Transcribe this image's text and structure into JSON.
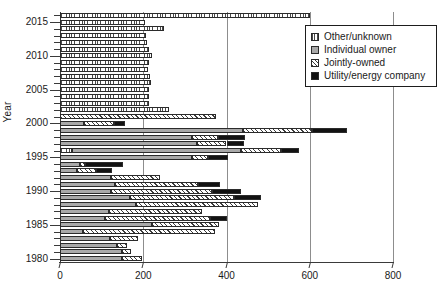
{
  "chart_data": {
    "type": "bar",
    "orientation": "horizontal",
    "stacked": true,
    "title": "",
    "xlabel": "",
    "ylabel": "Year",
    "xlim": [
      0,
      800
    ],
    "ylim": [
      1979.5,
      2016.5
    ],
    "xticks": [
      0,
      200,
      400,
      600,
      800
    ],
    "yticks": [
      1980,
      1985,
      1990,
      1995,
      2000,
      2005,
      2010,
      2015
    ],
    "grid": "vertical",
    "legend_position": "top-right",
    "series": [
      {
        "name": "Other/unknown",
        "key": "other",
        "color": "#ffffff",
        "hatch": "horizontal-dotted"
      },
      {
        "name": "Individual owner",
        "key": "individual",
        "color": "#a9a9a9",
        "hatch": "solid"
      },
      {
        "name": "Jointly-owned",
        "key": "joint",
        "color": "#ffffff",
        "hatch": "diagonal"
      },
      {
        "name": "Utility/energy company",
        "key": "utility",
        "color": "#121212",
        "hatch": "solid"
      }
    ],
    "categories": [
      1980,
      1981,
      1982,
      1983,
      1984,
      1985,
      1986,
      1987,
      1988,
      1989,
      1990,
      1991,
      1992,
      1993,
      1994,
      1995,
      1996,
      1997,
      1998,
      1999,
      2000,
      2001,
      2002,
      2003,
      2004,
      2005,
      2006,
      2007,
      2008,
      2009,
      2010,
      2011,
      2012,
      2013,
      2014,
      2015,
      2016
    ],
    "rows": [
      {
        "year": 2016,
        "other": 600,
        "individual": 0,
        "joint": 0,
        "utility": 0
      },
      {
        "year": 2015,
        "other": 205,
        "individual": 0,
        "joint": 0,
        "utility": 0
      },
      {
        "year": 2014,
        "other": 250,
        "individual": 0,
        "joint": 0,
        "utility": 0
      },
      {
        "year": 2013,
        "other": 207,
        "individual": 0,
        "joint": 0,
        "utility": 0
      },
      {
        "year": 2012,
        "other": 210,
        "individual": 0,
        "joint": 0,
        "utility": 0
      },
      {
        "year": 2011,
        "other": 214,
        "individual": 0,
        "joint": 0,
        "utility": 0
      },
      {
        "year": 2010,
        "other": 220,
        "individual": 0,
        "joint": 0,
        "utility": 0
      },
      {
        "year": 2009,
        "other": 214,
        "individual": 0,
        "joint": 0,
        "utility": 0
      },
      {
        "year": 2008,
        "other": 212,
        "individual": 0,
        "joint": 0,
        "utility": 0
      },
      {
        "year": 2007,
        "other": 216,
        "individual": 0,
        "joint": 0,
        "utility": 0
      },
      {
        "year": 2006,
        "other": 219,
        "individual": 0,
        "joint": 0,
        "utility": 0
      },
      {
        "year": 2005,
        "other": 214,
        "individual": 0,
        "joint": 0,
        "utility": 0
      },
      {
        "year": 2004,
        "other": 213,
        "individual": 0,
        "joint": 0,
        "utility": 0
      },
      {
        "year": 2003,
        "other": 215,
        "individual": 0,
        "joint": 0,
        "utility": 0
      },
      {
        "year": 2002,
        "other": 262,
        "individual": 0,
        "joint": 0,
        "utility": 0
      },
      {
        "year": 2001,
        "other": 0,
        "individual": 0,
        "joint": 375,
        "utility": 0
      },
      {
        "year": 2000,
        "other": 0,
        "individual": 58,
        "joint": 72,
        "utility": 26
      },
      {
        "year": 1999,
        "other": 0,
        "individual": 440,
        "joint": 165,
        "utility": 85
      },
      {
        "year": 1998,
        "other": 0,
        "individual": 318,
        "joint": 62,
        "utility": 65
      },
      {
        "year": 1997,
        "other": 0,
        "individual": 330,
        "joint": 70,
        "utility": 42
      },
      {
        "year": 1996,
        "other": 30,
        "individual": 405,
        "joint": 95,
        "utility": 45
      },
      {
        "year": 1995,
        "other": 0,
        "individual": 318,
        "joint": 38,
        "utility": 48
      },
      {
        "year": 1994,
        "other": 0,
        "individual": 48,
        "joint": 12,
        "utility": 92
      },
      {
        "year": 1993,
        "other": 0,
        "individual": 42,
        "joint": 44,
        "utility": 40
      },
      {
        "year": 1992,
        "other": 0,
        "individual": 122,
        "joint": 118,
        "utility": 0
      },
      {
        "year": 1991,
        "other": 0,
        "individual": 132,
        "joint": 200,
        "utility": 52
      },
      {
        "year": 1990,
        "other": 0,
        "individual": 122,
        "joint": 243,
        "utility": 70
      },
      {
        "year": 1989,
        "other": 0,
        "individual": 168,
        "joint": 250,
        "utility": 66
      },
      {
        "year": 1988,
        "other": 0,
        "individual": 183,
        "joint": 292,
        "utility": 0
      },
      {
        "year": 1987,
        "other": 0,
        "individual": 118,
        "joint": 222,
        "utility": 0
      },
      {
        "year": 1986,
        "other": 0,
        "individual": 108,
        "joint": 253,
        "utility": 40
      },
      {
        "year": 1985,
        "other": 0,
        "individual": 222,
        "joint": 160,
        "utility": 0
      },
      {
        "year": 1984,
        "other": 0,
        "individual": 55,
        "joint": 318,
        "utility": 0
      },
      {
        "year": 1983,
        "other": 0,
        "individual": 120,
        "joint": 68,
        "utility": 0
      },
      {
        "year": 1982,
        "other": 0,
        "individual": 138,
        "joint": 22,
        "utility": 0
      },
      {
        "year": 1981,
        "other": 0,
        "individual": 148,
        "joint": 22,
        "utility": 0
      },
      {
        "year": 1980,
        "other": 0,
        "individual": 150,
        "joint": 48,
        "utility": 0
      }
    ]
  },
  "legend": {
    "items": [
      {
        "label": "Other/unknown"
      },
      {
        "label": "Individual owner"
      },
      {
        "label": "Jointly-owned"
      },
      {
        "label": "Utility/energy company"
      }
    ]
  }
}
